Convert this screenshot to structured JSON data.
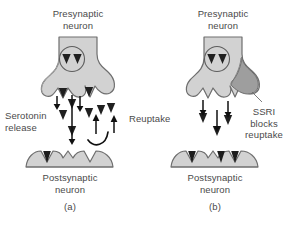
{
  "figure": {
    "background_color": "#ffffff",
    "cell_fill": "#d2d2d2",
    "cell_fill_light": "#dedede",
    "cell_stroke": "#6e6e6e",
    "shadow_fill": "#9a9a9a",
    "arrow_color": "#1a1a1a",
    "vesicle_color": "#2b2b2b",
    "text_color": "#4a4a4a"
  },
  "panels": [
    {
      "id": "a",
      "letter": "(a)",
      "presynaptic_label": "Presynaptic\nneuron",
      "postsynaptic_label": "Postsynaptic\nneuron",
      "annotations": [
        {
          "name": "serotonin-release",
          "text": "Serotonin\nrelease"
        },
        {
          "name": "reuptake",
          "text": "Reuptake"
        }
      ],
      "vesicle_count": 2,
      "release_arrows": 3,
      "reuptake_arrows": 2,
      "bound_receptors": 1,
      "empty_receptors": 3,
      "ssri_present": false
    },
    {
      "id": "b",
      "letter": "(b)",
      "presynaptic_label": "Presynaptic\nneuron",
      "postsynaptic_label": "Postsynaptic\nneuron",
      "annotations": [
        {
          "name": "ssri-blocks-reuptake",
          "text": "SSRI\nblocks\nreuptake"
        }
      ],
      "vesicle_count": 2,
      "release_arrows": 3,
      "reuptake_arrows": 0,
      "bound_receptors": 3,
      "empty_receptors": 1,
      "ssri_present": true
    }
  ]
}
